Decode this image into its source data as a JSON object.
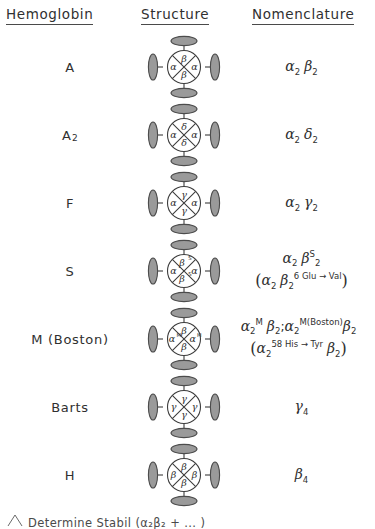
{
  "table": {
    "headers": {
      "hemoglobin": "Hemoglobin",
      "structure": "Structure",
      "nomenclature": "Nomenclature"
    },
    "rows": [
      {
        "name": "A",
        "name_sub": "",
        "structure": {
          "top": "β",
          "top_sup": "",
          "bottom": "β",
          "bottom_sup": "",
          "left": "α",
          "left_sup": "",
          "right": "α",
          "right_sup": ""
        },
        "nomenclature_lines": [
          "α2 β2"
        ]
      },
      {
        "name": "A",
        "name_sub": "2",
        "structure": {
          "top": "δ",
          "top_sup": "",
          "bottom": "δ",
          "bottom_sup": "",
          "left": "α",
          "left_sup": "",
          "right": "α",
          "right_sup": ""
        },
        "nomenclature_lines": [
          "α2 δ2"
        ]
      },
      {
        "name": "F",
        "name_sub": "",
        "structure": {
          "top": "γ",
          "top_sup": "",
          "bottom": "γ",
          "bottom_sup": "",
          "left": "α",
          "left_sup": "",
          "right": "α",
          "right_sup": ""
        },
        "nomenclature_lines": [
          "α2 γ2"
        ]
      },
      {
        "name": "S",
        "name_sub": "",
        "structure": {
          "top": "β",
          "top_sup": "S",
          "bottom": "β",
          "bottom_sup": "S",
          "left": "α",
          "left_sup": "",
          "right": "α",
          "right_sup": ""
        },
        "nomenclature_lines": [
          "α2 βS2",
          "(α2 β2 6 Glu → Val)"
        ]
      },
      {
        "name": "M (Boston)",
        "name_sub": "",
        "structure": {
          "top": "β",
          "top_sup": "",
          "bottom": "β",
          "bottom_sup": "",
          "left": "α",
          "left_sup": "M",
          "right": "α",
          "right_sup": "M"
        },
        "nomenclature_lines": [
          "α2M β2 ; α2M(Boston) β2",
          "(α2 58 His → Tyr β2)"
        ]
      },
      {
        "name": "Barts",
        "name_sub": "",
        "structure": {
          "top": "γ",
          "top_sup": "",
          "bottom": "γ",
          "bottom_sup": "",
          "left": "γ",
          "left_sup": "",
          "right": "γ",
          "right_sup": ""
        },
        "nomenclature_lines": [
          "γ4"
        ]
      },
      {
        "name": "H",
        "name_sub": "",
        "structure": {
          "top": "β",
          "top_sup": "",
          "bottom": "β",
          "bottom_sup": "",
          "left": "β",
          "left_sup": "",
          "right": "β",
          "right_sup": ""
        },
        "nomenclature_lines": [
          "β4"
        ]
      }
    ]
  },
  "nomenclature_rendered": {
    "row0": {
      "l1_a": "α",
      "l1_a_sub": "2",
      "l1_b": "β",
      "l1_b_sub": "2"
    },
    "row1": {
      "l1_a": "α",
      "l1_a_sub": "2",
      "l1_b": "δ",
      "l1_b_sub": "2"
    },
    "row2": {
      "l1_a": "α",
      "l1_a_sub": "2",
      "l1_b": "γ",
      "l1_b_sub": "2"
    },
    "row3": {
      "l1_a": "α",
      "l1_a_sub": "2",
      "l1_b": "β",
      "l1_b_sup": "S",
      "l1_b_sub": "2",
      "l2_open": "(",
      "l2_a": "α",
      "l2_a_sub": "2",
      "l2_b": "β",
      "l2_b_sub": "2",
      "l2_sup": "6 Glu → Val",
      "l2_close": ")"
    },
    "row4": {
      "l1_a": "α",
      "l1_a_sub": "2",
      "l1_a_sup": "M",
      "l1_b": "β",
      "l1_b_sub": "2",
      "l1_sep": ";",
      "l1_c": "α",
      "l1_c_sub": "2",
      "l1_c_sup": "M(Boston)",
      "l1_d": "β",
      "l1_d_sub": "2",
      "l2_open": "(",
      "l2_a": "α",
      "l2_a_sub": "2",
      "l2_sup": "58 His → Tyr",
      "l2_b": "β",
      "l2_b_sub": "2",
      "l2_close": ")"
    },
    "row5": {
      "l1_a": "γ",
      "l1_a_sub": "4"
    },
    "row6": {
      "l1_a": "β",
      "l1_a_sub": "4"
    }
  },
  "footnote": {
    "marker": "heme-triangle-icon",
    "text": "Determine Stabil (α₂β₂ + ... )"
  },
  "colors": {
    "ink": "#303030",
    "outline": "#3d3d3d",
    "lobe_fill": "#9a9a9a",
    "background": "#ffffff"
  }
}
